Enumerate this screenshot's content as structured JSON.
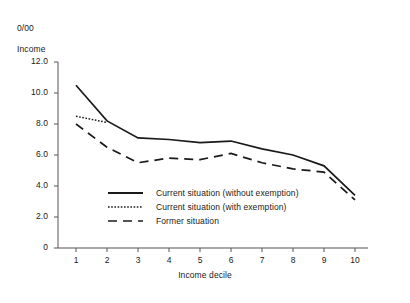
{
  "chart_data": {
    "type": "line",
    "title": "",
    "unit_label_line1": "0/00",
    "unit_label_line2": "Income",
    "xlabel": "Income decile",
    "ylabel": "",
    "categories": [
      "1",
      "2",
      "3",
      "4",
      "5",
      "6",
      "7",
      "8",
      "9",
      "10"
    ],
    "x": [
      1,
      2,
      3,
      4,
      5,
      6,
      7,
      8,
      9,
      10
    ],
    "xlim": [
      1,
      10
    ],
    "ylim": [
      0,
      12
    ],
    "ytick_labels": [
      "12.0",
      "10.0",
      "8.0",
      "6.0",
      "4.0",
      "2.0",
      "0"
    ],
    "ytick_values": [
      12,
      10,
      8,
      6,
      4,
      2,
      0
    ],
    "grid": false,
    "legend_position": "inside-lower-left",
    "series": [
      {
        "name": "Current situation (without exemption)",
        "style": "solid",
        "color": "#1a1a1a",
        "values": [
          10.5,
          8.2,
          7.1,
          7.0,
          6.8,
          6.9,
          6.4,
          6.0,
          5.3,
          3.4
        ]
      },
      {
        "name": "Current situation (with exemption)",
        "style": "dotted",
        "color": "#1a1a1a",
        "values": [
          8.5,
          8.1,
          7.1,
          7.0,
          6.8,
          6.9,
          6.4,
          6.0,
          5.3,
          3.4
        ]
      },
      {
        "name": "Former situation",
        "style": "dashed",
        "color": "#1a1a1a",
        "values": [
          8.0,
          6.5,
          5.5,
          5.8,
          5.7,
          6.1,
          5.5,
          5.1,
          4.9,
          3.1
        ]
      }
    ]
  },
  "axes": {
    "unit_caption": {
      "line1": "0/00",
      "line2": "Income"
    },
    "x_title": "Income decile"
  },
  "legend": {
    "items": [
      {
        "label": "Current situation (without exemption)",
        "style": "solid"
      },
      {
        "label": "Current situation (with exemption)",
        "style": "dotted"
      },
      {
        "label": "Former situation",
        "style": "dashed"
      }
    ]
  },
  "colors": {
    "ink": "#1a1a1a",
    "axis": "#555555",
    "background": "#ffffff"
  }
}
